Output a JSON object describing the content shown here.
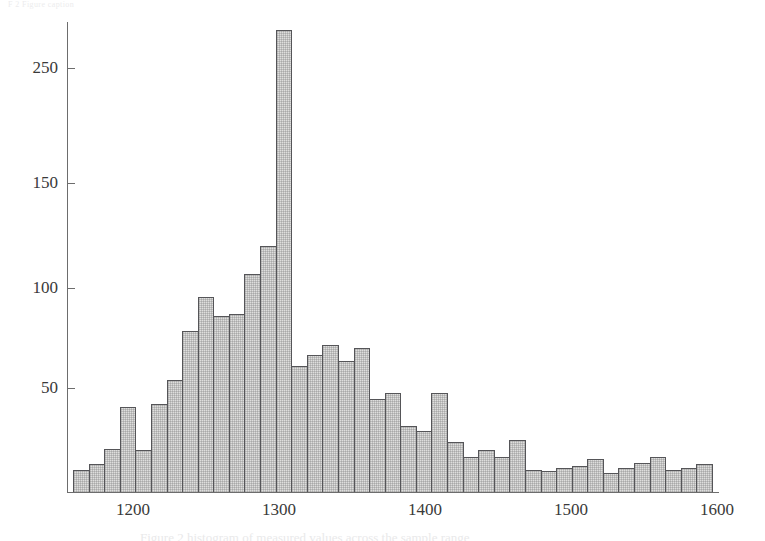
{
  "scan": {
    "header_text": "F 2  Figure  caption",
    "caption_text": "Figure 2  histogram of measured values across the sample range"
  },
  "chart_data": {
    "type": "bar",
    "subtype": "histogram",
    "title": "",
    "xlabel": "",
    "ylabel": "",
    "xlim": [
      1175,
      1605
    ],
    "ylim": [
      0,
      280
    ],
    "grid": false,
    "legend": "none",
    "bin_width": 10.7,
    "y_ticks": [
      50,
      100,
      150,
      250
    ],
    "y_tick_labels": [
      "50",
      "100",
      "150",
      "250"
    ],
    "x_ticks": [
      1200,
      1300,
      1400,
      1500,
      1600
    ],
    "x_tick_labels": [
      "1200",
      "1300",
      "1400",
      "1500",
      "1600"
    ],
    "bin_centers": [
      1180,
      1191,
      1202,
      1212,
      1223,
      1234,
      1244,
      1255,
      1266,
      1276,
      1287,
      1298,
      1308,
      1319,
      1330,
      1340,
      1351,
      1362,
      1372,
      1383,
      1394,
      1404,
      1415,
      1426,
      1436,
      1447,
      1458,
      1468,
      1479,
      1490,
      1500,
      1511,
      1522,
      1532,
      1543,
      1554,
      1564,
      1575,
      1586,
      1596
    ],
    "values": [
      13,
      16,
      25,
      49,
      24,
      51,
      65,
      93,
      113,
      102,
      103,
      126,
      142,
      267,
      73,
      79,
      85,
      76,
      83,
      54,
      57,
      38,
      35,
      57,
      29,
      20,
      24,
      20,
      30,
      13,
      12,
      14,
      15,
      19,
      11,
      14,
      17,
      20,
      13,
      14,
      16
    ],
    "peak": {
      "bin_center": 1298,
      "value": 267
    },
    "n_bins": 40
  },
  "axis_style": {
    "axis_color": "#6d6d6d",
    "bar_fill": "#dededd",
    "bar_edge": "#555558",
    "text_color": "#3a3a3a"
  }
}
